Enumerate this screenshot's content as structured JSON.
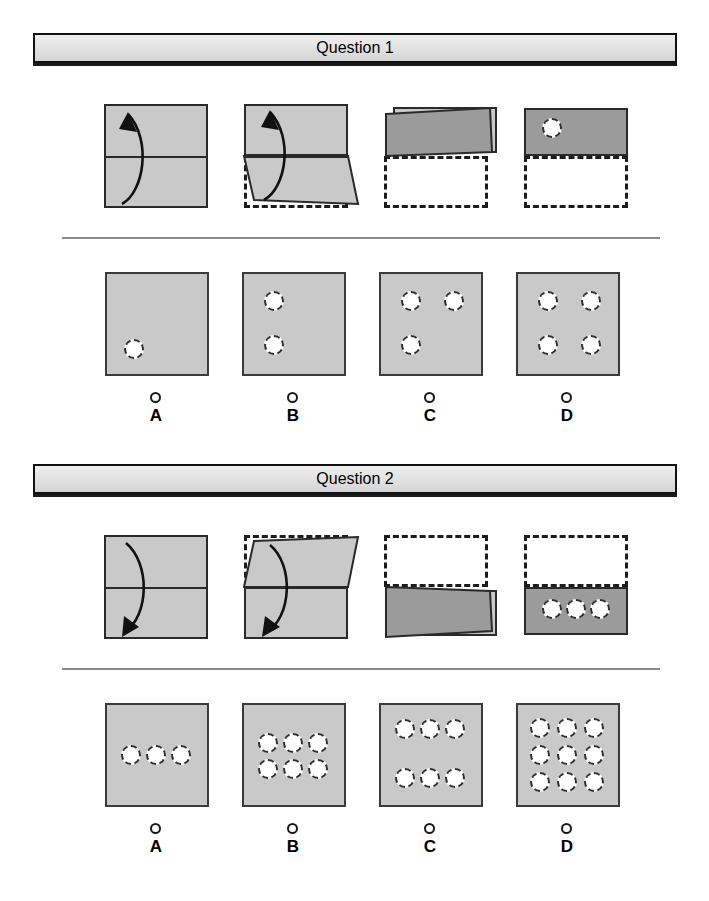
{
  "page": {
    "background_color": "#ffffff",
    "paper_light_color": "#c9c9c9",
    "paper_dark_color": "#9b9b9b",
    "hole_color": "#ffffff",
    "outline_color": "#2a2a2a"
  },
  "questions": [
    {
      "header_label": "Question 1",
      "fold_sequence": [
        {
          "step_name": "flat-sheet-with-fold-line",
          "description": "Square sheet with horizontal mid fold line and upward curved arrow",
          "arrow_direction": "up-left"
        },
        {
          "step_name": "folding-in-progress",
          "description": "Bottom half folding upward, dashed ghost shows original bottom position",
          "arrow_direction": "up-left"
        },
        {
          "step_name": "fold-complete",
          "description": "Folded flap resting over top half, dashed ghost of lower half below"
        },
        {
          "step_name": "hole-punched",
          "description": "One hole punched through folded sheet in upper-left area",
          "hole_count": 1
        }
      ],
      "options": [
        {
          "letter": "A",
          "hole_count": 1,
          "holes": [
            [
              0.22,
              0.7
            ]
          ]
        },
        {
          "letter": "B",
          "hole_count": 2,
          "holes": [
            [
              0.25,
              0.22
            ],
            [
              0.25,
              0.66
            ]
          ]
        },
        {
          "letter": "C",
          "hole_count": 3,
          "holes": [
            [
              0.25,
              0.22
            ],
            [
              0.7,
              0.22
            ],
            [
              0.25,
              0.66
            ]
          ]
        },
        {
          "letter": "D",
          "hole_count": 4,
          "holes": [
            [
              0.25,
              0.22
            ],
            [
              0.7,
              0.22
            ],
            [
              0.25,
              0.66
            ],
            [
              0.7,
              0.66
            ]
          ]
        }
      ]
    },
    {
      "header_label": "Question 2",
      "fold_sequence": [
        {
          "step_name": "flat-sheet-with-fold-line",
          "description": "Square sheet with horizontal mid fold line and downward curved arrow",
          "arrow_direction": "down-left"
        },
        {
          "step_name": "folding-in-progress",
          "description": "Top half folding downward, dashed ghost shows original top position",
          "arrow_direction": "down-left"
        },
        {
          "step_name": "fold-complete",
          "description": "Folded flap resting over bottom half, dashed ghost of upper half above"
        },
        {
          "step_name": "hole-punched",
          "description": "Three holes punched in a horizontal row through folded sheet",
          "hole_count": 3
        }
      ],
      "options": [
        {
          "letter": "A",
          "hole_count": 3,
          "holes": [
            [
              0.22,
              0.46
            ],
            [
              0.46,
              0.46
            ],
            [
              0.7,
              0.46
            ]
          ]
        },
        {
          "letter": "B",
          "hole_count": 6,
          "holes": [
            [
              0.22,
              0.34
            ],
            [
              0.46,
              0.34
            ],
            [
              0.7,
              0.34
            ],
            [
              0.22,
              0.62
            ],
            [
              0.46,
              0.62
            ],
            [
              0.7,
              0.62
            ]
          ]
        },
        {
          "letter": "C",
          "hole_count": 6,
          "holes": [
            [
              0.22,
              0.2
            ],
            [
              0.46,
              0.2
            ],
            [
              0.7,
              0.2
            ],
            [
              0.22,
              0.7
            ],
            [
              0.46,
              0.7
            ],
            [
              0.7,
              0.7
            ]
          ]
        },
        {
          "letter": "D",
          "hole_count": 9,
          "holes": [
            [
              0.2,
              0.2
            ],
            [
              0.47,
              0.2
            ],
            [
              0.74,
              0.2
            ],
            [
              0.2,
              0.47
            ],
            [
              0.47,
              0.47
            ],
            [
              0.74,
              0.47
            ],
            [
              0.2,
              0.74
            ],
            [
              0.47,
              0.74
            ],
            [
              0.74,
              0.74
            ]
          ]
        }
      ]
    }
  ]
}
